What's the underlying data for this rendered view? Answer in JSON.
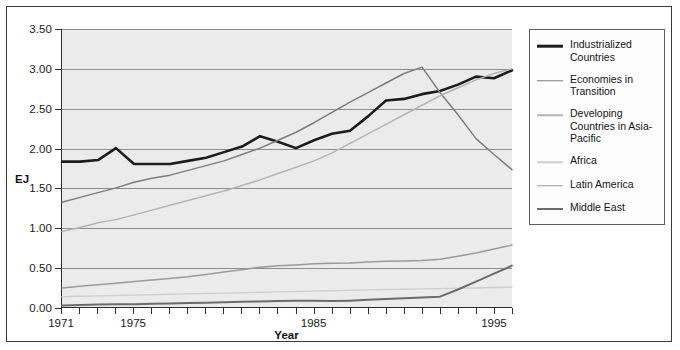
{
  "chart_data": {
    "type": "line",
    "title": "",
    "xlabel": "Year",
    "ylabel": "EJ",
    "xlim": [
      1971,
      1996
    ],
    "ylim": [
      0.0,
      3.5
    ],
    "grid": true,
    "legend_position": "right",
    "x": [
      1971,
      1972,
      1973,
      1974,
      1975,
      1976,
      1977,
      1978,
      1979,
      1980,
      1981,
      1982,
      1983,
      1984,
      1985,
      1986,
      1987,
      1988,
      1989,
      1990,
      1991,
      1992,
      1993,
      1994,
      1995,
      1996
    ],
    "ytick_labels": [
      "0.00",
      "0.50",
      "1.00",
      "1.50",
      "2.00",
      "2.50",
      "3.00",
      "3.50"
    ],
    "ytick_values": [
      0.0,
      0.5,
      1.0,
      1.5,
      2.0,
      2.5,
      3.0,
      3.5
    ],
    "xtick_labels": [
      "1971",
      "1975",
      "1985",
      "1995"
    ],
    "xtick_values": [
      1971,
      1975,
      1985,
      1995
    ],
    "series": [
      {
        "name": "Industrialized Countries",
        "color": "#1c1c1c",
        "width": 2.6,
        "values": [
          1.83,
          1.83,
          1.85,
          2.0,
          1.8,
          1.8,
          1.8,
          1.84,
          1.88,
          1.95,
          2.02,
          2.15,
          2.08,
          2.0,
          2.1,
          2.18,
          2.22,
          2.4,
          2.6,
          2.62,
          2.68,
          2.72,
          2.8,
          2.9,
          2.88,
          2.98
        ]
      },
      {
        "name": "Economies in Transition",
        "color": "#7d7d7d",
        "width": 1.5,
        "values": [
          1.32,
          1.38,
          1.44,
          1.5,
          1.57,
          1.62,
          1.66,
          1.72,
          1.78,
          1.84,
          1.92,
          2.0,
          2.1,
          2.2,
          2.32,
          2.45,
          2.58,
          2.7,
          2.82,
          2.94,
          3.02,
          2.7,
          2.42,
          2.12,
          1.92,
          1.73
        ]
      },
      {
        "name": "Developing Countries in Asia-Pacific",
        "color": "#b4b4b4",
        "width": 1.5,
        "values": [
          0.95,
          1.0,
          1.06,
          1.1,
          1.16,
          1.22,
          1.28,
          1.34,
          1.4,
          1.46,
          1.53,
          1.6,
          1.68,
          1.76,
          1.84,
          1.94,
          2.06,
          2.18,
          2.3,
          2.42,
          2.54,
          2.66,
          2.76,
          2.86,
          2.94,
          3.0
        ]
      },
      {
        "name": "Africa",
        "color": "#cfcfcf",
        "width": 1.4,
        "values": [
          0.13,
          0.135,
          0.14,
          0.145,
          0.15,
          0.155,
          0.16,
          0.165,
          0.17,
          0.175,
          0.18,
          0.185,
          0.19,
          0.195,
          0.2,
          0.205,
          0.21,
          0.215,
          0.22,
          0.223,
          0.228,
          0.232,
          0.236,
          0.24,
          0.245,
          0.25
        ]
      },
      {
        "name": "Latin America",
        "color": "#9a9a9a",
        "width": 1.5,
        "values": [
          0.24,
          0.26,
          0.28,
          0.3,
          0.32,
          0.34,
          0.36,
          0.38,
          0.41,
          0.44,
          0.47,
          0.5,
          0.52,
          0.53,
          0.545,
          0.55,
          0.555,
          0.565,
          0.575,
          0.58,
          0.585,
          0.6,
          0.64,
          0.68,
          0.73,
          0.78
        ]
      },
      {
        "name": "Middle East",
        "color": "#6b6b6b",
        "width": 2.0,
        "values": [
          0.02,
          0.025,
          0.03,
          0.035,
          0.035,
          0.04,
          0.045,
          0.05,
          0.055,
          0.06,
          0.065,
          0.07,
          0.075,
          0.08,
          0.08,
          0.075,
          0.08,
          0.09,
          0.1,
          0.11,
          0.12,
          0.13,
          0.22,
          0.32,
          0.42,
          0.52
        ]
      }
    ]
  },
  "legend": {
    "items": [
      {
        "label": "Industrialized Countries"
      },
      {
        "label": "Economies in Transition"
      },
      {
        "label": "Developing Countries in Asia-Pacific"
      },
      {
        "label": "Africa"
      },
      {
        "label": "Latin America"
      },
      {
        "label": "Middle East"
      }
    ]
  }
}
